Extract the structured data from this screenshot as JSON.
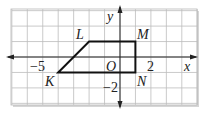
{
  "figure": {
    "type": "coordinate-plane-quadrilateral",
    "axes": {
      "x_label": "x",
      "y_label": "y",
      "origin_label": "O",
      "tick_labels": [
        {
          "axis": "x",
          "value": -5,
          "text": "−5"
        },
        {
          "axis": "x",
          "value": 2,
          "text": "2"
        },
        {
          "axis": "y",
          "value": -2,
          "text": "−2"
        }
      ],
      "x_range": [
        -7,
        5
      ],
      "y_range": [
        -3,
        3
      ]
    },
    "vertices": [
      {
        "name": "K",
        "x": -4,
        "y": -1
      },
      {
        "name": "L",
        "x": -2,
        "y": 1
      },
      {
        "name": "M",
        "x": 1,
        "y": 1
      },
      {
        "name": "N",
        "x": 1,
        "y": -1
      }
    ],
    "colors": {
      "grid": "#b8b8b8",
      "axis": "#222222",
      "shape": "#111111",
      "shadow": "#cfcfcf"
    }
  }
}
